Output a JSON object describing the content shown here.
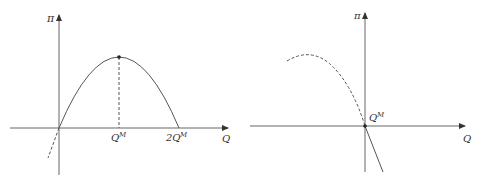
{
  "colors": {
    "background": "#ffffff",
    "line": "#555555",
    "text": "#333333"
  },
  "left_panel": {
    "y_axis_label": "π",
    "x_axis_label": "Q",
    "tick_qm": {
      "base": "Q",
      "sup": "M"
    },
    "tick_2qm": {
      "base": "2Q",
      "sup": "M"
    },
    "curve": "concave profit curve, zero at 0 and 2Q^M, maximum at Q^M",
    "dashed_vertical_at": "Q^M",
    "dashed_extension": "below origin (Q<0)"
  },
  "right_panel": {
    "y_axis_label": "π",
    "x_axis_label": "Q",
    "point_label": {
      "base": "Q",
      "sup": "M"
    },
    "curve": "dashed hump in Q<0 region, solid decreasing line for Q>0, point at origin labeled Q^M"
  }
}
